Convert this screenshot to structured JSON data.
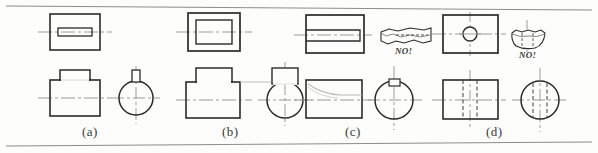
{
  "figure": {
    "background_color": "#fdfdfc",
    "line_color": "#2b2b2b",
    "centerline_color": "#9b9b9b",
    "hidden_line_color": "#4a4a4a",
    "faint_line_color": "#b9b9b9",
    "rule_color": "#8d8d8d",
    "top_rule": "",
    "bottom_rule": ""
  },
  "panels": [
    {
      "id": "a",
      "caption": "(a)",
      "top_view": "rectangle with narrow rectangular slot outline on horizontal centerline",
      "front_view": "rectangle with small raised block on top, horizontal centerline",
      "side_view": "circle with small rectangular key on top, crossed centerlines",
      "annotation": ""
    },
    {
      "id": "b",
      "caption": "(b)",
      "top_view": "rectangle with large inner rectangle outline on horizontal centerline",
      "front_view": "rectangle with wide raised block on top, horizontal centerline",
      "side_view": "circle with wide rectangular block on top, crossed centerlines",
      "annotation": ""
    },
    {
      "id": "c",
      "caption": "(c)",
      "top_view": "rectangle with long slot open to the left edge on horizontal centerline",
      "front_view": "rectangle with faint curved blend line near top left, horizontal centerline",
      "side_view": "circle with small keyway notch at top, crossed centerlines",
      "annotation": "NO!",
      "pictorial": "torn jagged block pictorial with dashed slot line"
    },
    {
      "id": "d",
      "caption": "(d)",
      "top_view": "rectangle with small circle hole at center, crossed centerlines",
      "front_view": "rectangle with two hidden dashed vertical lines and vertical centerline",
      "side_view": "circle with two hidden dashed vertical lines and crossed centerlines",
      "annotation": "NO!",
      "pictorial": "torn curved block pictorial with dashed hole lines"
    }
  ],
  "labels": {
    "caption_a": "(a)",
    "caption_b": "(b)",
    "caption_c": "(c)",
    "caption_d": "(d)",
    "no_c": "NO!",
    "no_d": "NO!"
  }
}
